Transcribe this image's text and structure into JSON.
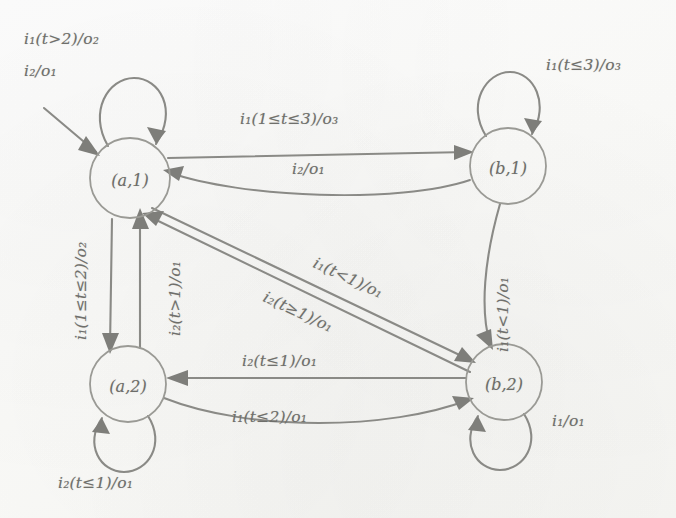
{
  "figure": {
    "type": "finite-state-machine-diagram",
    "title": "",
    "ink_color": "#8a8a86",
    "paper_color": "#fdfdfb"
  },
  "states": [
    {
      "id": "a1",
      "label_text": "(a,",
      "label_sub": "1",
      "label_close": ")",
      "full": "(a,1)",
      "cx": 130,
      "cy": 178,
      "r": 40
    },
    {
      "id": "b1",
      "label_text": "(b,",
      "label_sub": "1",
      "label_close": ")",
      "full": "(b,1)",
      "cx": 508,
      "cy": 166,
      "r": 38
    },
    {
      "id": "a2",
      "label_text": "(a,",
      "label_sub": "2",
      "label_close": ")",
      "full": "(a,2)",
      "cx": 128,
      "cy": 384,
      "r": 38
    },
    {
      "id": "b2",
      "label_text": "(b,",
      "label_sub": "2",
      "label_close": ")",
      "full": "(b,2)",
      "cx": 504,
      "cy": 382,
      "r": 38
    }
  ],
  "labels": {
    "loop_a1_line1": "i₁(t>2)/o₂",
    "loop_a1_line2": "i₂/o₁",
    "loop_b1": "i₁(t≤3)/o₃",
    "loop_a2": "i₂(t≤1)/o₁",
    "loop_b2": "i₁/o₁",
    "a1_to_b1": "i₁(1≤t≤3)/o₃",
    "b1_to_a1": "i₂/o₁",
    "a1_to_a2": "i₁(1≤t≤2)/o₂",
    "a2_to_a1": "i₂(t>1)/o₁",
    "b1_to_b2": "i₁(t<1)/o₁",
    "a1_to_b2": "i₁(t<1)/o₁",
    "b2_to_a1": "i₂(t≥1)/o₁",
    "b2_to_a2": "i₂(t≤1)/o₁",
    "a2_to_b2": "i₁(t≤2)/o₁"
  },
  "transitions": [
    {
      "name": "a1-self-loop-1",
      "from": "(a,1)",
      "to": "(a,1)",
      "input": "i₁",
      "guard": "t>2",
      "output": "o₂"
    },
    {
      "name": "a1-self-loop-2",
      "from": "(a,1)",
      "to": "(a,1)",
      "input": "i₂",
      "guard": "",
      "output": "o₁"
    },
    {
      "name": "b1-self-loop",
      "from": "(b,1)",
      "to": "(b,1)",
      "input": "i₁",
      "guard": "t≤3",
      "output": "o₃"
    },
    {
      "name": "a2-self-loop",
      "from": "(a,2)",
      "to": "(a,2)",
      "input": "i₂",
      "guard": "t≤1",
      "output": "o₁"
    },
    {
      "name": "b2-self-loop",
      "from": "(b,2)",
      "to": "(b,2)",
      "input": "i₁",
      "guard": "",
      "output": "o₁"
    },
    {
      "name": "a1-to-b1",
      "from": "(a,1)",
      "to": "(b,1)",
      "input": "i₁",
      "guard": "1≤t≤3",
      "output": "o₃"
    },
    {
      "name": "b1-to-a1",
      "from": "(b,1)",
      "to": "(a,1)",
      "input": "i₂",
      "guard": "",
      "output": "o₁"
    },
    {
      "name": "a1-to-a2",
      "from": "(a,1)",
      "to": "(a,2)",
      "input": "i₁",
      "guard": "1≤t≤2",
      "output": "o₂"
    },
    {
      "name": "a2-to-a1",
      "from": "(a,2)",
      "to": "(a,1)",
      "input": "i₂",
      "guard": "t>1",
      "output": "o₁"
    },
    {
      "name": "b1-to-b2",
      "from": "(b,1)",
      "to": "(b,2)",
      "input": "i₁",
      "guard": "t<1",
      "output": "o₁"
    },
    {
      "name": "a1-to-b2",
      "from": "(a,1)",
      "to": "(b,2)",
      "input": "i₁",
      "guard": "t<1",
      "output": "o₁"
    },
    {
      "name": "b2-to-a1",
      "from": "(b,2)",
      "to": "(a,1)",
      "input": "i₂",
      "guard": "t≥1",
      "output": "o₁"
    },
    {
      "name": "b2-to-a2",
      "from": "(b,2)",
      "to": "(a,2)",
      "input": "i₂",
      "guard": "t≤1",
      "output": "o₁"
    },
    {
      "name": "a2-to-b2",
      "from": "(a,2)",
      "to": "(b,2)",
      "input": "i₁",
      "guard": "t≤2",
      "output": "o₁"
    }
  ]
}
